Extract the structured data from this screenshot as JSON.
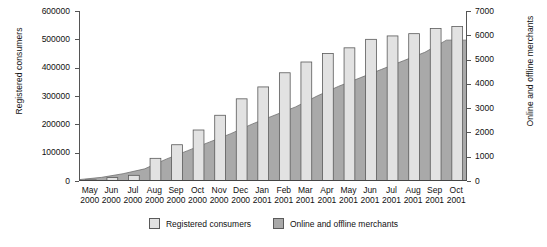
{
  "chart_data": {
    "type": "bar",
    "title": "",
    "subtitle": "",
    "xlabel": "",
    "ylabel": "Registered consumers",
    "y2label": "Online and offline merchants",
    "ylim": [
      0,
      600000
    ],
    "y2lim": [
      0,
      7000
    ],
    "ytick_labels": [
      "600000",
      "500000",
      "400000",
      "300000",
      "200000",
      "100000",
      "0"
    ],
    "ytick_values": [
      600000,
      500000,
      400000,
      300000,
      200000,
      100000,
      0
    ],
    "y2tick_labels": [
      "7000",
      "6000",
      "5000",
      "4000",
      "3000",
      "2000",
      "1000",
      "0"
    ],
    "y2tick_values": [
      7000,
      6000,
      5000,
      4000,
      3000,
      2000,
      1000,
      0
    ],
    "grid": false,
    "legend_position": "bottom",
    "categories": [
      {
        "month": "May",
        "year": "2000"
      },
      {
        "month": "Jun",
        "year": "2000"
      },
      {
        "month": "Jul",
        "year": "2000"
      },
      {
        "month": "Aug",
        "year": "2000"
      },
      {
        "month": "Sep",
        "year": "2000"
      },
      {
        "month": "Oct",
        "year": "2000"
      },
      {
        "month": "Nov",
        "year": "2000"
      },
      {
        "month": "Dec",
        "year": "2000"
      },
      {
        "month": "Jan",
        "year": "2001"
      },
      {
        "month": "Feb",
        "year": "2001"
      },
      {
        "month": "Mar",
        "year": "2001"
      },
      {
        "month": "Apr",
        "year": "2001"
      },
      {
        "month": "May",
        "year": "2001"
      },
      {
        "month": "Jun",
        "year": "2001"
      },
      {
        "month": "Jul",
        "year": "2001"
      },
      {
        "month": "Aug",
        "year": "2001"
      },
      {
        "month": "Sep",
        "year": "2001"
      },
      {
        "month": "Oct",
        "year": "2001"
      }
    ],
    "series": [
      {
        "name": "Registered consumers",
        "axis": "left",
        "render": "bar",
        "color": "#e2e2e2",
        "edge_color": "#5a5a5a",
        "values": [
          4000,
          12000,
          20000,
          80000,
          128000,
          180000,
          232000,
          290000,
          332000,
          382000,
          420000,
          450000,
          470000,
          500000,
          512000,
          520000,
          538000,
          545000
        ]
      },
      {
        "name": "Online and offline merchants",
        "axis": "right",
        "render": "area",
        "color": "#a9a9a9",
        "edge_color": "#707070",
        "values": [
          60,
          150,
          300,
          500,
          900,
          1250,
          1600,
          1950,
          2350,
          2700,
          3050,
          3500,
          3900,
          4250,
          4600,
          4950,
          5300,
          5800
        ]
      }
    ]
  },
  "legend": {
    "items": [
      {
        "label": "Registered consumers",
        "color": "#e2e2e2"
      },
      {
        "label": "Online and offline merchants",
        "color": "#a9a9a9"
      }
    ]
  }
}
